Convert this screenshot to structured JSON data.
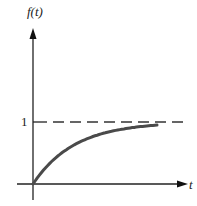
{
  "chart_data": {
    "type": "line",
    "title": "",
    "xlabel": "t",
    "ylabel": "f(t)",
    "y_ticks": [
      "1"
    ],
    "annotations": [
      "dashed asymptote at f(t) = 1"
    ],
    "series": [
      {
        "name": "f(t)",
        "description": "exponential approach to 1: f(t) = 1 - e^(-t)",
        "x": [
          0,
          0.5,
          1,
          1.5,
          2,
          2.5,
          3
        ],
        "values": [
          0,
          0.39,
          0.63,
          0.78,
          0.86,
          0.92,
          0.95
        ]
      }
    ],
    "asymptote": 1,
    "grid": false,
    "legend": "none"
  },
  "labels": {
    "y_axis": "f(t)",
    "x_axis": "t",
    "tick_one": "1"
  },
  "colors": {
    "axis": "#222222",
    "curve": "#4a4a4a",
    "dashed": "#333333"
  }
}
